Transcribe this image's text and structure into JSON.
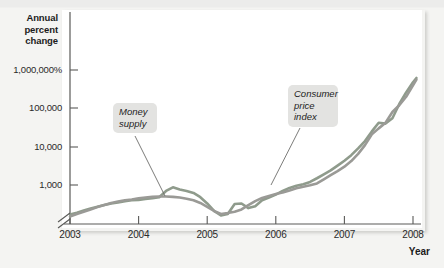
{
  "chart_data": {
    "type": "line",
    "title": "",
    "subtitle": "",
    "xlabel": "Year",
    "ylabel": "Annual percent change",
    "y_scale": "log",
    "y_axis_broken_at_origin": true,
    "grid": false,
    "legend_position": "inline-callouts",
    "xlim": [
      2003.0,
      2008.3
    ],
    "ylim": [
      100,
      3000000
    ],
    "xticks": [
      2003,
      2004,
      2005,
      2006,
      2007,
      2008
    ],
    "xtick_labels": [
      "2003",
      "2004",
      "2005",
      "2006",
      "2007",
      "2008"
    ],
    "yticks": [
      1000,
      10000,
      100000,
      1000000
    ],
    "ytick_labels": [
      "1,000",
      "10,000",
      "100,000",
      "1,000,000%"
    ],
    "annotations": [
      {
        "text": "Money supply",
        "series": "Money supply",
        "x": 2004.55,
        "y": 900
      },
      {
        "text": "Consumer price index",
        "series": "Consumer price index",
        "x": 2006.3,
        "y": 2500
      }
    ],
    "series": [
      {
        "name": "Money supply",
        "color": "#8f9b8c",
        "x": [
          2003.0,
          2003.1,
          2003.2,
          2003.3,
          2003.4,
          2003.5,
          2003.6,
          2003.7,
          2003.8,
          2003.9,
          2004.0,
          2004.1,
          2004.2,
          2004.3,
          2004.4,
          2004.5,
          2004.6,
          2004.7,
          2004.8,
          2004.9,
          2005.0,
          2005.1,
          2005.2,
          2005.3,
          2005.4,
          2005.5,
          2005.6,
          2005.7,
          2005.8,
          2005.9,
          2006.0,
          2006.1,
          2006.2,
          2006.3,
          2006.4,
          2006.5,
          2006.6,
          2006.7,
          2006.8,
          2006.9,
          2007.0,
          2007.1,
          2007.2,
          2007.3,
          2007.4,
          2007.5,
          2007.6,
          2007.7,
          2007.8,
          2007.9,
          2008.0,
          2008.05
        ],
        "y": [
          170,
          190,
          215,
          245,
          270,
          300,
          330,
          350,
          380,
          400,
          410,
          430,
          450,
          480,
          700,
          870,
          760,
          700,
          620,
          480,
          330,
          210,
          160,
          175,
          320,
          330,
          250,
          280,
          400,
          470,
          560,
          700,
          840,
          950,
          1050,
          1200,
          1500,
          1900,
          2400,
          3200,
          4300,
          6000,
          9000,
          14000,
          25000,
          42000,
          40000,
          55000,
          130000,
          260000,
          480000,
          620000
        ]
      },
      {
        "name": "Consumer price index",
        "color": "#9a9a96",
        "x": [
          2003.0,
          2003.1,
          2003.2,
          2003.3,
          2003.4,
          2003.5,
          2003.6,
          2003.7,
          2003.8,
          2003.9,
          2004.0,
          2004.1,
          2004.2,
          2004.3,
          2004.4,
          2004.5,
          2004.6,
          2004.7,
          2004.8,
          2004.9,
          2005.0,
          2005.1,
          2005.2,
          2005.3,
          2005.4,
          2005.5,
          2005.6,
          2005.7,
          2005.8,
          2005.9,
          2006.0,
          2006.1,
          2006.2,
          2006.3,
          2006.4,
          2006.5,
          2006.6,
          2006.7,
          2006.8,
          2006.9,
          2007.0,
          2007.1,
          2007.2,
          2007.3,
          2007.4,
          2007.5,
          2007.6,
          2007.7,
          2007.8,
          2007.9,
          2008.0,
          2008.05
        ],
        "y": [
          150,
          175,
          200,
          230,
          265,
          300,
          340,
          370,
          400,
          420,
          450,
          470,
          490,
          500,
          500,
          490,
          470,
          440,
          400,
          340,
          270,
          210,
          175,
          185,
          200,
          230,
          300,
          380,
          460,
          520,
          580,
          640,
          720,
          820,
          900,
          980,
          1100,
          1400,
          1800,
          2300,
          3000,
          4200,
          6500,
          11000,
          21000,
          30000,
          42000,
          80000,
          120000,
          200000,
          400000,
          560000
        ]
      }
    ]
  },
  "axes": {
    "y_title": "Annual\npercent\nchange",
    "y_title_line1": "Annual",
    "y_title_line2": "percent",
    "y_title_line3": "change",
    "x_title": "Year"
  },
  "labels": {
    "money_supply_line1": "Money",
    "money_supply_line2": "supply",
    "cpi_line1": "Consumer",
    "cpi_line2": "price",
    "cpi_line3": "index"
  },
  "colors": {
    "money_supply": "#8f9b8c",
    "consumer_price_index": "#9a9a96",
    "axis": "#5a5a58",
    "page_background": "#f4f4f2",
    "plot_background": "#ffffff",
    "callout_background": "#e3e3e1",
    "text": "#1d1d1d"
  }
}
